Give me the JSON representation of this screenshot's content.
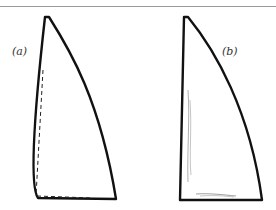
{
  "figure": {
    "panels": [
      {
        "id": "a",
        "label": "(a)",
        "description": "sail outline with dashed straight luff and foot lines"
      },
      {
        "id": "b",
        "label": "(b)",
        "description": "sail outline with straight luff and light shading strokes"
      }
    ],
    "colors": {
      "stroke": "#111111",
      "rule": "#9a9a9a",
      "background": "#ffffff"
    }
  }
}
